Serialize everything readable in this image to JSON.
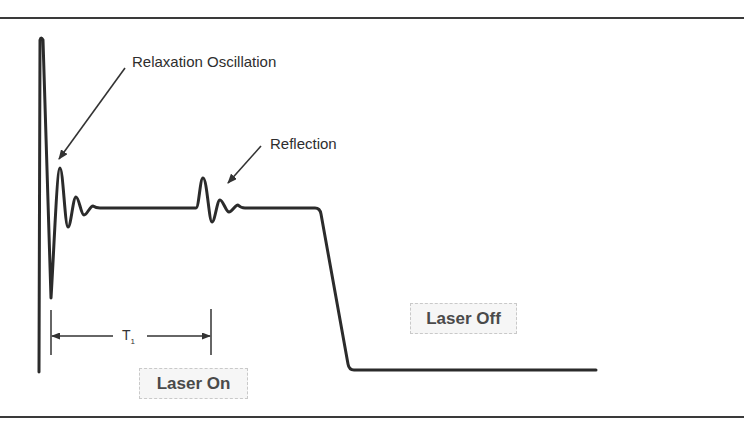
{
  "figure": {
    "annotations": {
      "relaxation": "Relaxation Oscillation",
      "reflection": "Reflection",
      "interval_label": "T",
      "interval_subscript": "1"
    },
    "states": {
      "on": "Laser On",
      "off": "Laser Off"
    },
    "colors": {
      "trace": "#2b2b2b",
      "rule": "#3a3a3a",
      "box_bg": "#f6f6f6",
      "box_border": "#c9c9c9",
      "text": "#2e2e2e"
    }
  },
  "waveform": {
    "steady_level_y": 208,
    "off_level_y": 370,
    "start_spike": {
      "x": 41,
      "top_y": 38,
      "bottom_y": 372
    },
    "relaxation_points": [
      [
        51,
        298
      ],
      [
        60,
        168
      ],
      [
        68,
        227
      ],
      [
        76,
        197
      ],
      [
        84,
        215
      ],
      [
        93,
        206
      ],
      [
        100,
        208
      ]
    ],
    "reflection_points": [
      [
        196,
        208
      ],
      [
        203,
        178
      ],
      [
        212,
        222
      ],
      [
        220,
        200
      ],
      [
        229,
        212
      ],
      [
        238,
        205
      ],
      [
        245,
        208
      ]
    ],
    "fall_edge": {
      "start": [
        318,
        208
      ],
      "end": [
        350,
        370
      ]
    },
    "end_x": 596
  }
}
